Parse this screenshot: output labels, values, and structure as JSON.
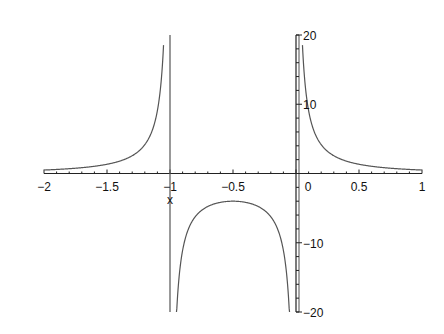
{
  "chart_data": {
    "type": "line",
    "title": "",
    "function": "1/(x*(x+1))",
    "xlabel": "x",
    "ylabel": "",
    "xlim": [
      -2,
      1
    ],
    "ylim": [
      -20,
      20
    ],
    "x_ticks": [
      -2,
      -1.5,
      -1,
      -0.5,
      0,
      0.5,
      1
    ],
    "x_tick_labels": [
      "-2",
      "-1.5",
      "-1",
      "-0.5",
      "0",
      "0.5",
      "1"
    ],
    "y_ticks": [
      -20,
      -10,
      10,
      20
    ],
    "y_tick_labels": [
      "-20",
      "-10",
      "10",
      "20"
    ],
    "grid": false,
    "legend": null,
    "asymptotes": [
      -1,
      0
    ],
    "series": [
      {
        "name": "left branch",
        "x": [
          -2,
          -1.8,
          -1.6,
          -1.4,
          -1.3,
          -1.2,
          -1.15,
          -1.1,
          -1.05
        ],
        "values": [
          0.5,
          0.69,
          1.04,
          1.79,
          2.56,
          4.17,
          5.8,
          9.09,
          19.05
        ]
      },
      {
        "name": "middle branch",
        "x": [
          -0.95,
          -0.9,
          -0.8,
          -0.7,
          -0.6,
          -0.5,
          -0.4,
          -0.3,
          -0.2,
          -0.1,
          -0.05
        ],
        "values": [
          -21.05,
          -11.11,
          -6.25,
          -4.76,
          -4.17,
          -4.0,
          -4.17,
          -4.76,
          -6.25,
          -11.11,
          -21.05
        ]
      },
      {
        "name": "right branch",
        "x": [
          0.05,
          0.1,
          0.2,
          0.3,
          0.4,
          0.5,
          0.6,
          0.7,
          0.8,
          0.9,
          1.0
        ],
        "values": [
          19.05,
          9.09,
          4.17,
          2.56,
          1.79,
          1.33,
          1.04,
          0.84,
          0.69,
          0.58,
          0.5
        ]
      }
    ]
  },
  "labels": {
    "x_axis_name": "x"
  },
  "colors": {
    "curve": "#555555",
    "axis": "#222222"
  }
}
